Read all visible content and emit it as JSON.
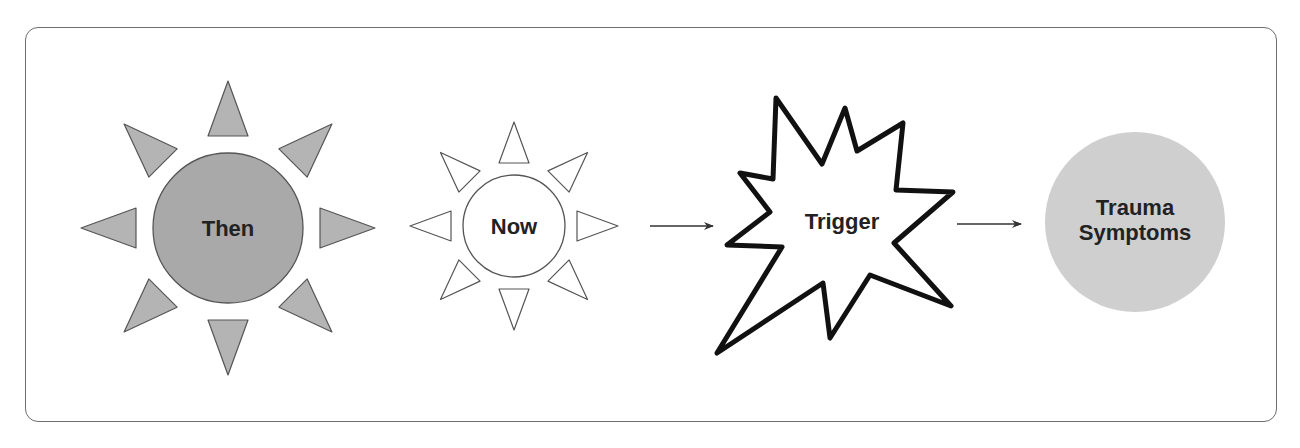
{
  "diagram": {
    "type": "flow",
    "nodes": [
      {
        "id": "then",
        "label": "Then",
        "shape": "sun-filled"
      },
      {
        "id": "now",
        "label": "Now",
        "shape": "sun-outline"
      },
      {
        "id": "trigger",
        "label": "Trigger",
        "shape": "starburst"
      },
      {
        "id": "trauma",
        "label_line1": "Trauma",
        "label_line2": "Symptoms",
        "shape": "circle-filled"
      }
    ],
    "edges": [
      {
        "from": "now",
        "to": "trigger"
      },
      {
        "from": "trigger",
        "to": "trauma"
      }
    ]
  },
  "colors": {
    "frame_border": "#6e6e6e",
    "then_fill": "#a9a9a9",
    "then_ray_fill": "#b4b4b4",
    "outline": "#555555",
    "trauma_fill": "#cfcfcf",
    "text": "#222222",
    "arrow": "#333333",
    "starburst_stroke": "#111111"
  }
}
